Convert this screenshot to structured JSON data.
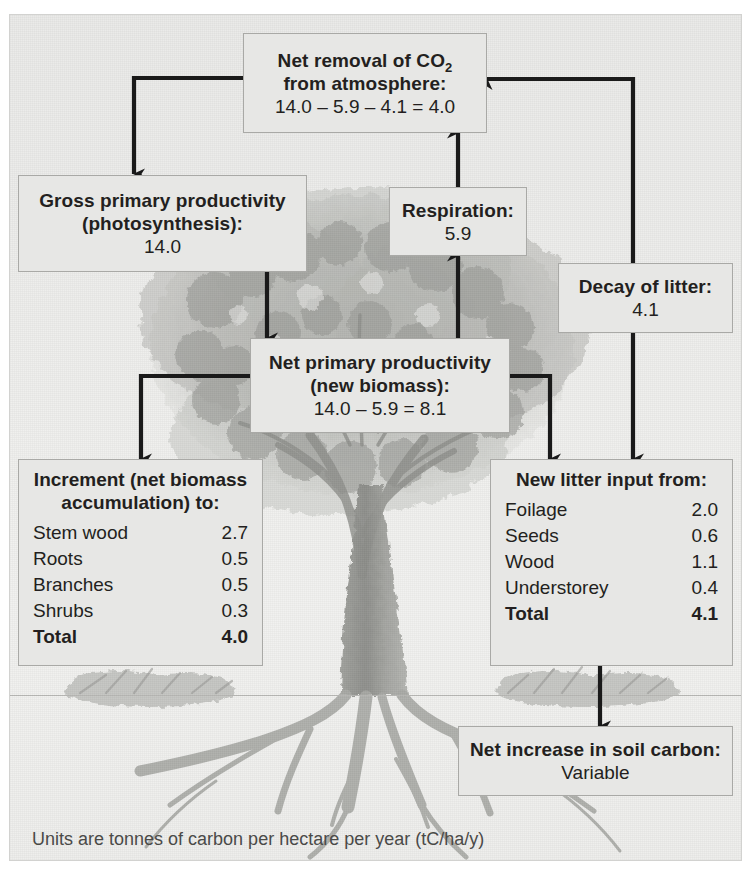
{
  "diagram": {
    "caption": "Units are tonnes of carbon per hectare per year (tC/ha/y)",
    "accent_color": "#1a1a1a",
    "box_fill": "#e7e7e5",
    "box_border": "#a9a9a6"
  },
  "boxes": {
    "net_removal": {
      "title_line1": "Net removal of CO",
      "title_sub": "2",
      "title_line2": "from atmosphere:",
      "value": "14.0 – 5.9 – 4.1 = 4.0"
    },
    "gross_primary": {
      "title_line1": "Gross primary productivity",
      "title_line2": "(photosynthesis):",
      "value": "14.0"
    },
    "respiration": {
      "title": "Respiration:",
      "value": "5.9"
    },
    "decay_of_litter": {
      "title": "Decay of litter:",
      "value": "4.1"
    },
    "net_primary": {
      "title_line1": "Net primary productivity",
      "title_line2": "(new biomass):",
      "value": "14.0 – 5.9 = 8.1"
    },
    "increment": {
      "heading_line1": "Increment (net biomass",
      "heading_line2": "accumulation) to:",
      "rows": [
        {
          "label": "Stem wood",
          "value": "2.7",
          "total": false
        },
        {
          "label": "Roots",
          "value": "0.5",
          "total": false
        },
        {
          "label": "Branches",
          "value": "0.5",
          "total": false
        },
        {
          "label": "Shrubs",
          "value": "0.3",
          "total": false
        },
        {
          "label": "Total",
          "value": "4.0",
          "total": true
        }
      ]
    },
    "new_litter": {
      "heading": "New litter input from:",
      "rows": [
        {
          "label": "Foilage",
          "value": "2.0",
          "total": false
        },
        {
          "label": "Seeds",
          "value": "0.6",
          "total": false
        },
        {
          "label": "Wood",
          "value": "1.1",
          "total": false
        },
        {
          "label": "Understorey",
          "value": "0.4",
          "total": false
        },
        {
          "label": "Total",
          "value": "4.1",
          "total": true
        }
      ]
    },
    "soil_carbon": {
      "title": "Net increase in soil carbon:",
      "value": "Variable"
    }
  },
  "chart_data": {
    "type": "diagram",
    "units": "tC/ha/y",
    "nodes": [
      {
        "id": "net_removal",
        "label": "Net removal of CO2 from atmosphere",
        "value": 4.0,
        "expression": "14.0 - 5.9 - 4.1 = 4.0"
      },
      {
        "id": "gross_primary",
        "label": "Gross primary productivity (photosynthesis)",
        "value": 14.0
      },
      {
        "id": "respiration",
        "label": "Respiration",
        "value": 5.9
      },
      {
        "id": "decay_of_litter",
        "label": "Decay of litter",
        "value": 4.1
      },
      {
        "id": "net_primary",
        "label": "Net primary productivity (new biomass)",
        "value": 8.1,
        "expression": "14.0 - 5.9 = 8.1"
      },
      {
        "id": "increment",
        "label": "Increment (net biomass accumulation) to",
        "value": 4.0
      },
      {
        "id": "new_litter",
        "label": "New litter input from",
        "value": 4.1
      },
      {
        "id": "soil_carbon",
        "label": "Net increase in soil carbon",
        "value": "Variable"
      }
    ],
    "edges": [
      {
        "from": "net_removal",
        "to": "gross_primary"
      },
      {
        "from": "gross_primary",
        "to": "net_primary"
      },
      {
        "from": "net_primary",
        "to": "respiration"
      },
      {
        "from": "respiration",
        "to": "net_removal"
      },
      {
        "from": "decay_of_litter",
        "to": "net_removal"
      },
      {
        "from": "net_primary",
        "to": "increment"
      },
      {
        "from": "net_primary",
        "to": "new_litter"
      },
      {
        "from": "decay_of_litter",
        "to": "new_litter"
      },
      {
        "from": "new_litter",
        "to": "soil_carbon"
      }
    ],
    "breakdowns": {
      "increment": {
        "categories": [
          "Stem wood",
          "Roots",
          "Branches",
          "Shrubs"
        ],
        "values": [
          2.7,
          0.5,
          0.5,
          0.3
        ],
        "total": 4.0
      },
      "new_litter": {
        "categories": [
          "Foilage",
          "Seeds",
          "Wood",
          "Understorey"
        ],
        "values": [
          2.0,
          0.6,
          1.1,
          0.4
        ],
        "total": 4.1
      }
    }
  }
}
